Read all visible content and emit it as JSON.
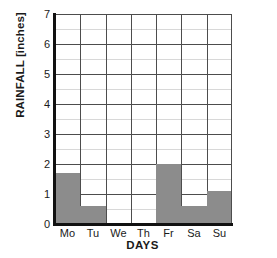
{
  "chart_data": {
    "type": "bar",
    "title": "",
    "xlabel": "DAYS",
    "ylabel": "RAINFALL [inches]",
    "categories": [
      "Mo",
      "Tu",
      "We",
      "Th",
      "Fr",
      "Sa",
      "Su"
    ],
    "values": [
      1.7,
      0.6,
      0,
      0,
      2.0,
      0.6,
      1.1
    ],
    "ylim": [
      0,
      7
    ],
    "ytick_labels": [
      "0",
      "1",
      "2",
      "3",
      "4",
      "5",
      "6",
      "7"
    ],
    "ytick_values": [
      0,
      1,
      2,
      3,
      4,
      5,
      6,
      7
    ],
    "minor_tick_step": 0.5,
    "grid": "both",
    "legend": "none",
    "bar_color": "#8c8c8c",
    "grid_color": "#4d4d4d",
    "minor_grid_color": "#d8d8d8",
    "axis_color": "#111111",
    "background": "#ffffff"
  }
}
